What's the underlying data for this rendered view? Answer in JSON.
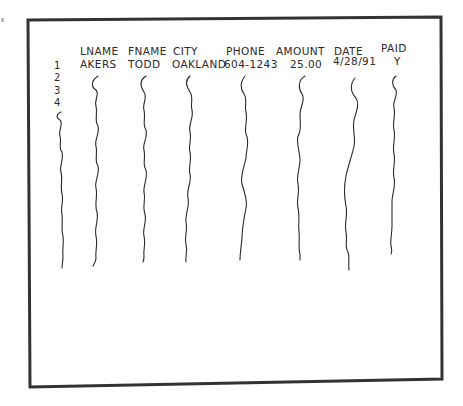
{
  "sheet": {
    "description": "Hand-drawn sketch of a data file / table",
    "columns": [
      {
        "key": "lname",
        "label": "LNAME"
      },
      {
        "key": "fname",
        "label": "FNAME"
      },
      {
        "key": "city",
        "label": "CITY"
      },
      {
        "key": "phone",
        "label": "PHONE"
      },
      {
        "key": "amount",
        "label": "AMOUNT"
      },
      {
        "key": "date",
        "label": "DATE"
      },
      {
        "key": "paid",
        "label": "PAID"
      }
    ],
    "row_numbers": [
      "1",
      "2",
      "3",
      "4"
    ],
    "rows": [
      {
        "lname": "AKERS",
        "fname": "TODD",
        "city": "OAKLAND",
        "phone": "604-1243",
        "amount": "25.00",
        "date": "4/28/91",
        "paid": "Y"
      }
    ],
    "continuation": "wavy lines indicate further records continue down each column"
  },
  "colors": {
    "ink": "#2a2a2a",
    "frame": "#333333",
    "paper": "#ffffff"
  }
}
